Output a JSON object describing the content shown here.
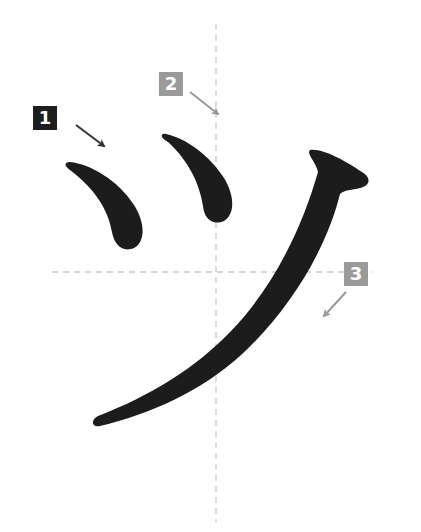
{
  "diagram": {
    "title": "",
    "character": "ツ",
    "guides": {
      "color": "#c8c8c8",
      "style": "dashed",
      "vertical_x": 216,
      "horizontal_y": 272
    },
    "stroke_color": "#1c1c1c",
    "strokes": [
      {
        "order": 1,
        "label": "1",
        "badge_color": "#1e1e1e",
        "arrow_color": "#333333"
      },
      {
        "order": 2,
        "label": "2",
        "badge_color": "#9a9a9a",
        "arrow_color": "#999999"
      },
      {
        "order": 3,
        "label": "3",
        "badge_color": "#9a9a9a",
        "arrow_color": "#999999"
      }
    ]
  }
}
